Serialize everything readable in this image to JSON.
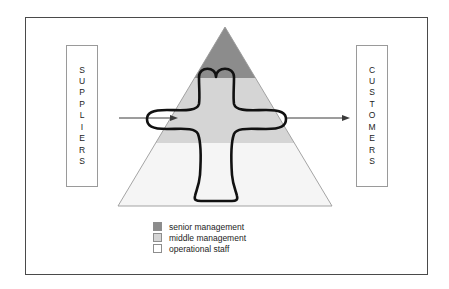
{
  "diagram": {
    "frame": {
      "border_color": "#4a4a4a"
    },
    "left_box": {
      "name": "SUPPLIERS",
      "letters": [
        "S",
        "U",
        "P",
        "P",
        "L",
        "I",
        "E",
        "R",
        "S"
      ]
    },
    "right_box": {
      "name": "CUSTOMERS",
      "letters": [
        "C",
        "U",
        "S",
        "T",
        "O",
        "M",
        "E",
        "R",
        "S"
      ]
    },
    "arrows": [
      {
        "id": "input-arrow",
        "direction": "right",
        "from": "suppliers",
        "to": "pyramid"
      },
      {
        "id": "output-arrow",
        "direction": "right",
        "from": "pyramid",
        "to": "customers"
      }
    ],
    "pyramid": {
      "bands": [
        {
          "id": "senior",
          "label": "senior management",
          "color": "#8c8c8c"
        },
        {
          "id": "middle",
          "label": "middle management",
          "color": "#d5d5d5"
        },
        {
          "id": "operational",
          "label": "operational staff",
          "color": "#f5f5f5"
        }
      ],
      "outline_color": "#9a9a9a"
    },
    "process_shape": {
      "id": "cross-process-outline",
      "stroke_color": "#111111",
      "fill": "none",
      "description": "cross-shaped process spanning all three hierarchy bands"
    },
    "legend": {
      "items": [
        {
          "label": "senior management",
          "color": "#8c8c8c"
        },
        {
          "label": "middle management",
          "color": "#d5d5d5"
        },
        {
          "label": "operational staff",
          "color": "#ffffff"
        }
      ]
    }
  }
}
